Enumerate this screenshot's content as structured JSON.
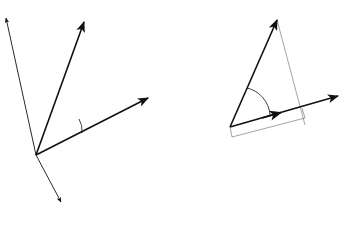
{
  "panel_a": {
    "caption": "(a)",
    "vectors": {
      "a": {
        "label": "a"
      },
      "b": {
        "label": "b"
      },
      "a_prime": {
        "label": "a′ = [−a_y, a_x]",
        "name_part": "a′",
        "eq_part": " = [−a",
        "sub1": "y",
        "mid": ", a",
        "sub2": "x",
        "end": "]"
      },
      "a_double_prime": {
        "label": "a″ = [a_y, −a_x]",
        "name_part": "a″",
        "eq_part": " = [a",
        "sub1": "y",
        "mid": ", −a",
        "sub2": "x",
        "end": "]"
      }
    },
    "angle_label": "θ"
  },
  "panel_b": {
    "caption": "(b)",
    "vectors": {
      "a": {
        "label": "a"
      },
      "b": {
        "label": "b"
      }
    },
    "angle_label": "θ",
    "unit_vector": {
      "num": "a",
      "den": "‖a‖"
    },
    "projection_label": {
      "prefix": "b · ",
      "num": "a",
      "den": "‖a‖"
    }
  },
  "colors": {
    "stroke": "#111111",
    "thin": "#555555",
    "background": "#ffffff"
  }
}
